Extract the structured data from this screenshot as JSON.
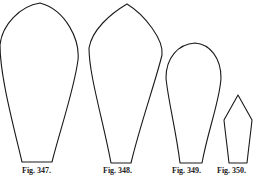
{
  "figures": [
    {
      "id": "347",
      "caption": "Fig. 347."
    },
    {
      "id": "348",
      "caption": "Fig. 348."
    },
    {
      "id": "349",
      "caption": "Fig. 349."
    },
    {
      "id": "350",
      "caption": "Fig. 350."
    }
  ],
  "colors": {
    "stroke": "#1a1a1a",
    "background": "#ffffff"
  }
}
